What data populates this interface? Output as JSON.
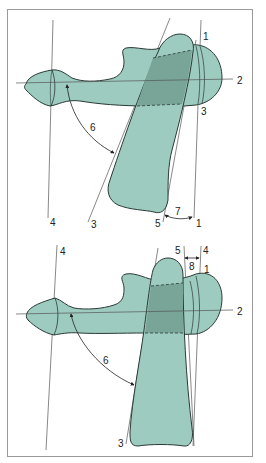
{
  "colors": {
    "fill": "#9ecbbf",
    "overlap": "#78a597",
    "outline": "#2a3a36",
    "line": "#555555",
    "frame": "#9a9a9a"
  },
  "top_panel": {
    "labels": {
      "l1_top": "1",
      "l2": "2",
      "l3_right": "3",
      "l6": "6",
      "l4_bottom": "4",
      "l3_bottom": "3",
      "l5_bottom": "5",
      "l7": "7",
      "l1_bottom": "1"
    }
  },
  "bottom_panel": {
    "labels": {
      "l4_left": "4",
      "l5_top": "5",
      "l4_top": "4",
      "l8": "8",
      "l1": "1",
      "l2": "2",
      "l6": "6",
      "l3_bottom": "3"
    }
  }
}
